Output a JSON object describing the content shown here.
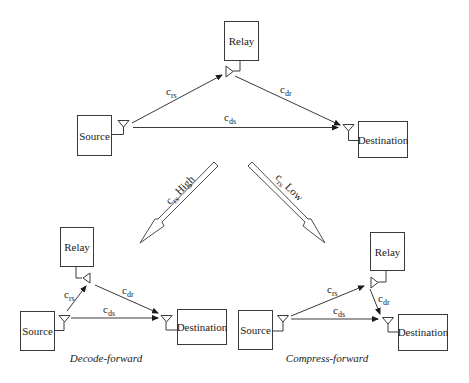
{
  "top": {
    "nodes": {
      "relay": "Relay",
      "source": "Source",
      "destination": "Destination"
    },
    "links": {
      "rs": {
        "base": "c",
        "sub": "rs"
      },
      "dr": {
        "base": "c",
        "sub": "dr"
      },
      "ds": {
        "base": "c",
        "sub": "ds"
      }
    }
  },
  "branches": {
    "left": {
      "base": "c",
      "sub": "rs",
      "label": " High"
    },
    "right": {
      "base": "c",
      "sub": "rs",
      "label": " Low"
    }
  },
  "decode_forward": {
    "caption": "Decode-forward",
    "nodes": {
      "relay": "Relay",
      "source": "Source",
      "destination": "Destination"
    },
    "links": {
      "rs": {
        "base": "c",
        "sub": "rs"
      },
      "dr": {
        "base": "c",
        "sub": "dr"
      },
      "ds": {
        "base": "c",
        "sub": "ds"
      }
    }
  },
  "compress_forward": {
    "caption": "Compress-forward",
    "nodes": {
      "relay": "Relay",
      "source": "Source",
      "destination": "Destination"
    },
    "links": {
      "rs": {
        "base": "c",
        "sub": "rs"
      },
      "dr": {
        "base": "c",
        "sub": "dr"
      },
      "ds": {
        "base": "c",
        "sub": "ds"
      }
    }
  },
  "icons": {
    "antenna": "triangle-antenna-icon",
    "arrowhead": "filled-arrowhead"
  },
  "colors": {
    "stroke": "#3a3a3a",
    "text": "#222222",
    "background": "#ffffff"
  }
}
